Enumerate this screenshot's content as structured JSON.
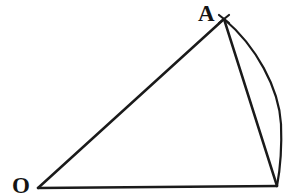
{
  "figure": {
    "kind": "geometry-diagram",
    "canvas": {
      "width": 290,
      "height": 196
    },
    "colors": {
      "background": "#ffffff",
      "ink": "#1a1a1a",
      "label": "#141414"
    },
    "stroke": {
      "width": 2.4,
      "arc_width": 2.2,
      "linecap": "round"
    },
    "labels": [
      {
        "id": "A",
        "text": "A",
        "x": 198,
        "y": 2,
        "font_size": 23,
        "bold": true
      },
      {
        "id": "O",
        "text": "O",
        "x": 12,
        "y": 174,
        "font_size": 23,
        "bold": true
      }
    ],
    "points": {
      "O": {
        "x": 38,
        "y": 188
      },
      "A": {
        "x": 224,
        "y": 19
      },
      "B": {
        "x": 277,
        "y": 186
      }
    },
    "segments": [
      {
        "name": "segment-OA",
        "from": "O",
        "to": "A",
        "d": "M 38 188 L 224 19"
      },
      {
        "name": "segment-AB",
        "from": "A",
        "to": "B",
        "d": "M 224 19 L 277 186"
      },
      {
        "name": "segment-OB",
        "from": "O",
        "to": "B",
        "d": "M 38 188 L 277 186"
      }
    ],
    "arc": {
      "name": "arc-AB",
      "from": "A",
      "to": "B",
      "bulge_direction": "right",
      "max_bulge_x": 281,
      "max_bulge_y": 122,
      "d": "M 224 19 C 256 46 279 88 281 124 C 282 148 280 170 277 186"
    },
    "apex_tick": {
      "name": "apex-tick-mark",
      "shape": "x-cross",
      "x": 224,
      "y": 19,
      "size": 7,
      "d": "M 219 15 L 229 23 M 229 15 L 219 23"
    }
  }
}
